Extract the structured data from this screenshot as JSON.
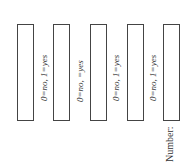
{
  "fields": [
    {
      "label": "0=no, 1=yes"
    },
    {
      "label": "0=no,  =yes"
    },
    {
      "label": "0=no, 1=yes"
    },
    {
      "label": "0=no, 1=yes"
    }
  ],
  "number_label": "Number:"
}
